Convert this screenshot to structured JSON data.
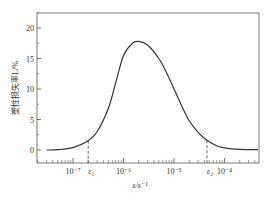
{
  "chart_data": {
    "type": "line",
    "title": "",
    "xlabel": "ε/s⁻¹",
    "ylabel": "塑性损失率L/%",
    "x_scale": "log",
    "xlim": [
      3e-08,
      0.0005
    ],
    "ylim": [
      -2.5,
      23
    ],
    "yticks": [
      0,
      5,
      10,
      15,
      20
    ],
    "xticks": [
      {
        "value": 1e-07,
        "label": "10⁻⁷"
      },
      {
        "value": 1e-06,
        "label": "10⁻⁶"
      },
      {
        "value": 1e-05,
        "label": "10⁻⁵"
      },
      {
        "value": 0.0001,
        "label": "10⁻⁴"
      }
    ],
    "annotations": [
      {
        "label": "ε₁",
        "x": 2e-07,
        "style": "dashed vertical"
      },
      {
        "label": "ε₂",
        "x": 4.5e-05,
        "style": "dashed vertical"
      }
    ],
    "grid": false,
    "legend": null,
    "series": [
      {
        "name": "Plastic loss rate",
        "x": [
          3e-08,
          5e-08,
          1e-07,
          2e-07,
          3e-07,
          5e-07,
          7e-07,
          1e-06,
          1.5e-06,
          2e-06,
          3e-06,
          5e-06,
          7e-06,
          1e-05,
          1.5e-05,
          2e-05,
          3e-05,
          4.5e-05,
          7e-05,
          0.0001,
          0.0002,
          0.0005
        ],
        "values": [
          0,
          0.05,
          0.4,
          1.5,
          3.0,
          6.8,
          11.0,
          15.5,
          17.5,
          17.8,
          17.2,
          15.0,
          12.8,
          10.0,
          6.8,
          4.8,
          2.9,
          1.6,
          0.7,
          0.35,
          0.1,
          0.05
        ]
      }
    ]
  }
}
